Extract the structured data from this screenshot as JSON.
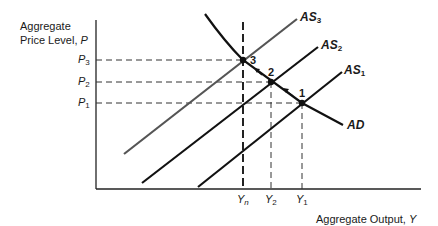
{
  "diagram": {
    "title": "",
    "y_axis": {
      "label_line1": "Aggregate",
      "label_line2": "Price Level, ",
      "var": "P"
    },
    "x_axis": {
      "label": "Aggregate Output, ",
      "var": "Y"
    },
    "price_ticks": [
      {
        "base": "P",
        "sub": "3"
      },
      {
        "base": "P",
        "sub": "2"
      },
      {
        "base": "P",
        "sub": "1"
      }
    ],
    "output_ticks": [
      {
        "base": "Y",
        "sub": "n"
      },
      {
        "base": "Y",
        "sub": "2"
      },
      {
        "base": "Y",
        "sub": "1"
      }
    ],
    "curves": [
      {
        "base": "AS",
        "sub": "3"
      },
      {
        "base": "AS",
        "sub": "2"
      },
      {
        "base": "AS",
        "sub": "1"
      },
      {
        "base": "AD",
        "sub": ""
      }
    ],
    "points": [
      "1",
      "2",
      "3"
    ]
  }
}
